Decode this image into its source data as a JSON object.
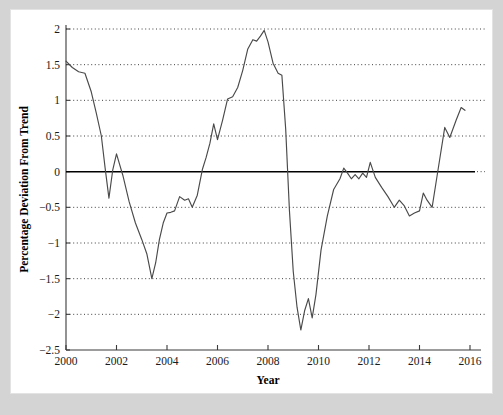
{
  "chart_data": {
    "type": "line",
    "title": "",
    "xlabel": "Year",
    "ylabel": "Percentage Deviation From Trend",
    "xlim": [
      2000.0,
      2016.0
    ],
    "ylim": [
      -2.5,
      2.0
    ],
    "xticks": [
      "2000",
      "2002",
      "2004",
      "2006",
      "2008",
      "2010",
      "2012",
      "2014",
      "2016"
    ],
    "xtick_values": [
      2000,
      2002,
      2004,
      2006,
      2008,
      2010,
      2012,
      2014,
      2016
    ],
    "yticks": [
      "2",
      "1.5",
      "1",
      "0.5",
      "0",
      "-0.5",
      "-1",
      "-1.5",
      "-2",
      "-2.5"
    ],
    "ytick_values": [
      2,
      1.5,
      1,
      0.5,
      0,
      -0.5,
      -1,
      -1.5,
      -2,
      -2.5
    ],
    "grid": true,
    "grid_style": "dotted-horizontal",
    "zero_line": true,
    "legend": false,
    "legend_position": "none",
    "line_color": "#4a4a4a",
    "background_color": "#ffffff",
    "frame_color": "#d4d4d4",
    "series": [
      {
        "name": "Percentage Deviation From Trend",
        "x": [
          2000.0,
          2000.25,
          2000.5,
          2000.75,
          2001.0,
          2001.2,
          2001.4,
          2001.55,
          2001.7,
          2001.85,
          2002.0,
          2002.25,
          2002.5,
          2002.75,
          2003.0,
          2003.2,
          2003.4,
          2003.55,
          2003.7,
          2003.85,
          2004.0,
          2004.15,
          2004.3,
          2004.5,
          2004.7,
          2004.85,
          2005.0,
          2005.2,
          2005.4,
          2005.55,
          2005.7,
          2005.85,
          2006.0,
          2006.2,
          2006.4,
          2006.6,
          2006.8,
          2007.0,
          2007.2,
          2007.4,
          2007.55,
          2007.7,
          2007.85,
          2008.0,
          2008.2,
          2008.4,
          2008.55,
          2008.7,
          2008.85,
          2009.0,
          2009.15,
          2009.3,
          2009.45,
          2009.6,
          2009.75,
          2009.9,
          2010.1,
          2010.35,
          2010.6,
          2010.85,
          2011.0,
          2011.15,
          2011.3,
          2011.45,
          2011.6,
          2011.75,
          2011.9,
          2012.05,
          2012.25,
          2012.5,
          2012.75,
          2013.0,
          2013.2,
          2013.4,
          2013.6,
          2013.8,
          2014.0,
          2014.15,
          2014.3,
          2014.5,
          2014.7,
          2015.0,
          2015.2,
          2015.45,
          2015.65,
          2015.8
        ],
        "values": [
          1.55,
          1.46,
          1.4,
          1.38,
          1.12,
          0.82,
          0.5,
          0.05,
          -0.37,
          0.02,
          0.25,
          -0.05,
          -0.42,
          -0.72,
          -0.95,
          -1.15,
          -1.5,
          -1.28,
          -0.95,
          -0.72,
          -0.58,
          -0.57,
          -0.55,
          -0.35,
          -0.4,
          -0.38,
          -0.5,
          -0.33,
          0.03,
          0.2,
          0.4,
          0.67,
          0.45,
          0.72,
          1.02,
          1.05,
          1.18,
          1.42,
          1.72,
          1.85,
          1.83,
          1.9,
          1.98,
          1.82,
          1.52,
          1.38,
          1.35,
          0.6,
          -0.55,
          -1.4,
          -1.9,
          -2.22,
          -1.95,
          -1.78,
          -2.05,
          -1.72,
          -1.1,
          -0.62,
          -0.25,
          -0.1,
          0.05,
          -0.02,
          -0.1,
          -0.04,
          -0.1,
          -0.02,
          -0.08,
          0.13,
          -0.08,
          -0.22,
          -0.35,
          -0.5,
          -0.4,
          -0.48,
          -0.62,
          -0.58,
          -0.55,
          -0.3,
          -0.4,
          -0.5,
          -0.05,
          0.62,
          0.48,
          0.72,
          0.9,
          0.86
        ]
      }
    ]
  },
  "figure": {
    "x_axis_title": "Year",
    "y_axis_title": "Percentage Deviation From Trend"
  }
}
